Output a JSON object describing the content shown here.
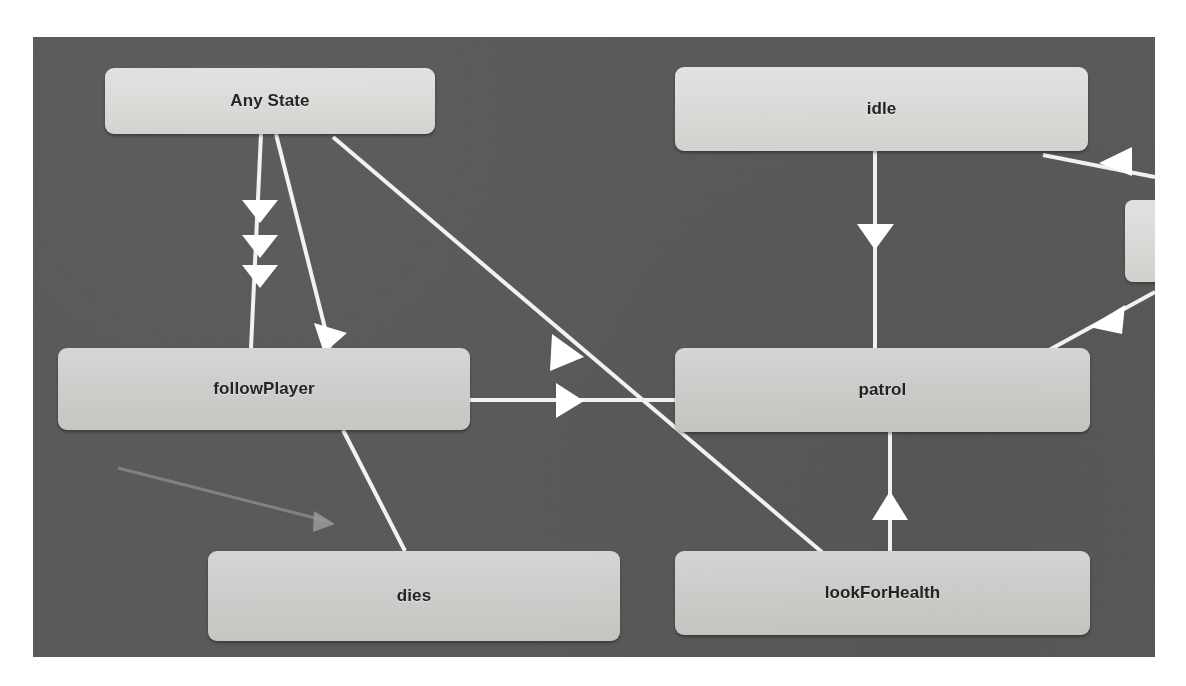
{
  "app": {
    "view": "Animator State Machine",
    "background_color": "#5a5a5a",
    "node_color": "#d2d2cf",
    "transition_color": "#ffffff",
    "muted_transition_color": "#8e8e8e"
  },
  "canvas": {
    "x": 33,
    "y": 37,
    "width": 1122,
    "height": 620
  },
  "nodes": [
    {
      "id": "any-state",
      "label": "Any State",
      "x": 72,
      "y": 31,
      "w": 330,
      "h": 66,
      "tone": "light"
    },
    {
      "id": "idle",
      "label": "idle",
      "x": 642,
      "y": 30,
      "w": 413,
      "h": 84,
      "tone": "light"
    },
    {
      "id": "follow-player",
      "label": "followPlayer",
      "x": 25,
      "y": 311,
      "w": 412,
      "h": 82,
      "tone": "normal"
    },
    {
      "id": "patrol",
      "label": "patrol",
      "x": 642,
      "y": 311,
      "w": 415,
      "h": 84,
      "tone": "normal"
    },
    {
      "id": "dies",
      "label": "dies",
      "x": 175,
      "y": 514,
      "w": 412,
      "h": 90,
      "tone": "normal"
    },
    {
      "id": "look-for-health",
      "label": "lookForHealth",
      "x": 642,
      "y": 514,
      "w": 415,
      "h": 84,
      "tone": "normal"
    },
    {
      "id": "offscreen-state",
      "label": "",
      "x": 1092,
      "y": 163,
      "w": 60,
      "h": 82,
      "tone": "light"
    }
  ],
  "transitions": [
    {
      "id": "any-state-to-follow-player-a",
      "from": "any-state",
      "to": "follow-player",
      "style": "solid",
      "arrow_count": 3
    },
    {
      "id": "any-state-to-follow-player-b",
      "from": "any-state",
      "to": "follow-player",
      "style": "solid",
      "arrow_count": 1
    },
    {
      "id": "any-state-to-look-for-health",
      "from": "any-state",
      "to": "look-for-health",
      "style": "solid",
      "arrow_count": 1
    },
    {
      "id": "idle-to-patrol",
      "from": "idle",
      "to": "patrol",
      "style": "solid",
      "arrow_count": 1
    },
    {
      "id": "follow-player-to-patrol",
      "from": "follow-player",
      "to": "patrol",
      "style": "solid",
      "arrow_count": 1
    },
    {
      "id": "follow-player-to-dies",
      "from": "follow-player",
      "to": "dies",
      "style": "solid",
      "arrow_count": 0
    },
    {
      "id": "look-for-health-to-patrol",
      "from": "look-for-health",
      "to": "patrol",
      "style": "solid",
      "arrow_count": 1
    },
    {
      "id": "offscreen-to-idle",
      "from": "offscreen-state",
      "to": "idle",
      "style": "solid",
      "arrow_count": 1
    },
    {
      "id": "offscreen-to-patrol",
      "from": "offscreen-state",
      "to": "patrol",
      "style": "solid",
      "arrow_count": 1
    },
    {
      "id": "muted-transition",
      "from": "follow-player",
      "to": "dies",
      "style": "muted",
      "arrow_count": 1
    }
  ]
}
